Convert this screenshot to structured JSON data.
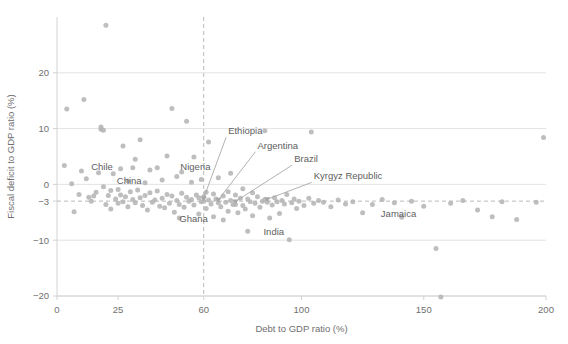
{
  "chart_data": {
    "type": "scatter",
    "title": "",
    "xlabel": "Debt to GDP ratio (%)",
    "ylabel": "Fiscal deficit to GDP ratio (%)",
    "xlim": [
      0,
      200
    ],
    "ylim": [
      -20,
      30
    ],
    "xticks": [
      0,
      25,
      60,
      100,
      150,
      200
    ],
    "xtick_labels": [
      "0",
      "25",
      "60",
      "100",
      "150",
      "200"
    ],
    "yticks": [
      20,
      10,
      0,
      -3,
      -10,
      -20
    ],
    "ytick_labels": [
      "20",
      "10",
      "0",
      "−3",
      "−10",
      "−20"
    ],
    "grid": "horizontal-only",
    "legend": "none",
    "point_color": "#b5b5b5",
    "reference_lines": [
      {
        "axis": "x",
        "value": 60,
        "style": "dashed",
        "color": "#b9b9b9"
      },
      {
        "axis": "y",
        "value": -3,
        "style": "dashed",
        "color": "#b9b9b9"
      }
    ],
    "annotations": [
      {
        "label": "Chile",
        "label_x": 14,
        "label_y": 3.2,
        "point_x": 18,
        "point_y": 2.0,
        "leader": false
      },
      {
        "label": "China",
        "label_x": 22,
        "label_y": 0.6,
        "point_x": 18,
        "point_y": 0.2,
        "leader": false
      },
      {
        "label": "Nigeria",
        "label_x": 48,
        "label_y": 3.2,
        "point_x": 41,
        "point_y": 3.0,
        "leader": false
      },
      {
        "label": "Ghana",
        "label_x": 50,
        "label_y": -6.2,
        "point_x": 50,
        "point_y": -6.0,
        "leader": false
      },
      {
        "label": "Ethiopia",
        "label_x": 70,
        "label_y": 9.0,
        "point_x": 60,
        "point_y": -3.0,
        "leader": true
      },
      {
        "label": "Argentina",
        "label_x": 82,
        "label_y": 6.4,
        "point_x": 66,
        "point_y": -3.3,
        "leader": true
      },
      {
        "label": "Brazil",
        "label_x": 97,
        "label_y": 4.0,
        "point_x": 73,
        "point_y": -3.6,
        "leader": true
      },
      {
        "label": "Kyrgyz Republic",
        "label_x": 105,
        "label_y": 0.9,
        "point_x": 86,
        "point_y": -3.2,
        "leader": true
      },
      {
        "label": "India",
        "label_x": 82,
        "label_y": -8.5,
        "point_x": 78,
        "point_y": -8.4,
        "leader": false
      },
      {
        "label": "Jamaica",
        "label_x": 130,
        "label_y": -5.2,
        "point_x": 125,
        "point_y": -5.1,
        "leader": false
      }
    ],
    "points": [
      [
        3,
        3.4
      ],
      [
        4,
        13.5
      ],
      [
        6,
        0.1
      ],
      [
        7,
        -4.9
      ],
      [
        9,
        -1.8
      ],
      [
        10,
        2.4
      ],
      [
        11,
        15.2
      ],
      [
        12,
        1.0
      ],
      [
        13,
        -2.3
      ],
      [
        14,
        -3.0
      ],
      [
        15,
        -2.1
      ],
      [
        16,
        -1.4
      ],
      [
        17,
        2.1
      ],
      [
        18,
        9.9
      ],
      [
        18,
        10.3
      ],
      [
        19,
        9.7
      ],
      [
        19,
        -0.4
      ],
      [
        20,
        28.5
      ],
      [
        20,
        -3.6
      ],
      [
        21,
        -2.0
      ],
      [
        22,
        -1.1
      ],
      [
        22,
        -4.4
      ],
      [
        23,
        1.9
      ],
      [
        24,
        -2.6
      ],
      [
        25,
        -0.9
      ],
      [
        25,
        -3.4
      ],
      [
        26,
        2.8
      ],
      [
        26,
        -1.9
      ],
      [
        27,
        6.9
      ],
      [
        27,
        -3.1
      ],
      [
        28,
        -2.2
      ],
      [
        29,
        0.6
      ],
      [
        29,
        -4.0
      ],
      [
        30,
        -1.3
      ],
      [
        31,
        3.0
      ],
      [
        31,
        -2.7
      ],
      [
        32,
        4.5
      ],
      [
        32,
        -3.3
      ],
      [
        33,
        -1.0
      ],
      [
        34,
        8.0
      ],
      [
        34,
        -2.4
      ],
      [
        35,
        -3.8
      ],
      [
        36,
        0.3
      ],
      [
        36,
        -2.0
      ],
      [
        37,
        -4.6
      ],
      [
        38,
        2.6
      ],
      [
        38,
        -1.5
      ],
      [
        39,
        -3.2
      ],
      [
        40,
        -2.8
      ],
      [
        41,
        3.0
      ],
      [
        41,
        -1.2
      ],
      [
        42,
        -3.9
      ],
      [
        43,
        0.8
      ],
      [
        43,
        -2.5
      ],
      [
        44,
        -4.2
      ],
      [
        45,
        5.1
      ],
      [
        45,
        -1.8
      ],
      [
        46,
        -3.4
      ],
      [
        47,
        13.6
      ],
      [
        47,
        -2.1
      ],
      [
        48,
        -5.0
      ],
      [
        49,
        1.4
      ],
      [
        49,
        -2.9
      ],
      [
        50,
        -6.0
      ],
      [
        50,
        -3.6
      ],
      [
        51,
        2.2
      ],
      [
        51,
        -1.6
      ],
      [
        52,
        -4.1
      ],
      [
        53,
        11.3
      ],
      [
        53,
        -2.3
      ],
      [
        54,
        -3.0
      ],
      [
        55,
        0.4
      ],
      [
        55,
        -2.7
      ],
      [
        56,
        4.9
      ],
      [
        56,
        -3.7
      ],
      [
        57,
        -1.9
      ],
      [
        58,
        -2.4
      ],
      [
        58,
        -5.3
      ],
      [
        59,
        -3.1
      ],
      [
        59,
        0.9
      ],
      [
        60,
        -3.0
      ],
      [
        60,
        -2.2
      ],
      [
        61,
        -4.3
      ],
      [
        61,
        -1.4
      ],
      [
        62,
        7.6
      ],
      [
        62,
        -2.8
      ],
      [
        63,
        -3.5
      ],
      [
        64,
        -1.7
      ],
      [
        64,
        -5.8
      ],
      [
        65,
        -2.6
      ],
      [
        66,
        -3.3
      ],
      [
        66,
        1.2
      ],
      [
        67,
        -4.0
      ],
      [
        68,
        -2.1
      ],
      [
        68,
        -6.4
      ],
      [
        69,
        -3.2
      ],
      [
        70,
        -1.3
      ],
      [
        70,
        -4.8
      ],
      [
        71,
        2.0
      ],
      [
        71,
        -2.9
      ],
      [
        72,
        -3.6
      ],
      [
        73,
        -3.6
      ],
      [
        73,
        -1.9
      ],
      [
        74,
        -5.1
      ],
      [
        75,
        -2.5
      ],
      [
        76,
        -3.8
      ],
      [
        76,
        -0.8
      ],
      [
        77,
        -4.4
      ],
      [
        78,
        -8.4
      ],
      [
        78,
        -2.6
      ],
      [
        79,
        -3.1
      ],
      [
        80,
        -1.5
      ],
      [
        80,
        -5.6
      ],
      [
        81,
        -3.4
      ],
      [
        82,
        -2.2
      ],
      [
        83,
        -4.1
      ],
      [
        84,
        -3.0
      ],
      [
        85,
        9.6
      ],
      [
        85,
        -2.7
      ],
      [
        86,
        -3.2
      ],
      [
        87,
        -6.0
      ],
      [
        88,
        -3.7
      ],
      [
        89,
        -2.4
      ],
      [
        90,
        -3.1
      ],
      [
        91,
        -5.2
      ],
      [
        92,
        -2.9
      ],
      [
        93,
        -3.5
      ],
      [
        94,
        -1.8
      ],
      [
        95,
        -9.9
      ],
      [
        96,
        -3.3
      ],
      [
        97,
        -2.6
      ],
      [
        98,
        -4.3
      ],
      [
        99,
        -3.0
      ],
      [
        101,
        -3.8
      ],
      [
        103,
        -2.5
      ],
      [
        104,
        9.4
      ],
      [
        105,
        -3.4
      ],
      [
        107,
        -2.9
      ],
      [
        109,
        -3.2
      ],
      [
        112,
        -4.0
      ],
      [
        115,
        -2.8
      ],
      [
        118,
        -3.5
      ],
      [
        121,
        -3.1
      ],
      [
        125,
        -5.1
      ],
      [
        129,
        -3.6
      ],
      [
        133,
        -2.7
      ],
      [
        138,
        -3.3
      ],
      [
        141,
        -5.9
      ],
      [
        145,
        -3.0
      ],
      [
        150,
        -3.9
      ],
      [
        155,
        -11.5
      ],
      [
        157,
        -20.2
      ],
      [
        161,
        -3.4
      ],
      [
        166,
        -2.9
      ],
      [
        172,
        -4.6
      ],
      [
        178,
        -5.8
      ],
      [
        182,
        -3.1
      ],
      [
        188,
        -6.3
      ],
      [
        196,
        -3.2
      ],
      [
        199,
        8.4
      ]
    ]
  }
}
